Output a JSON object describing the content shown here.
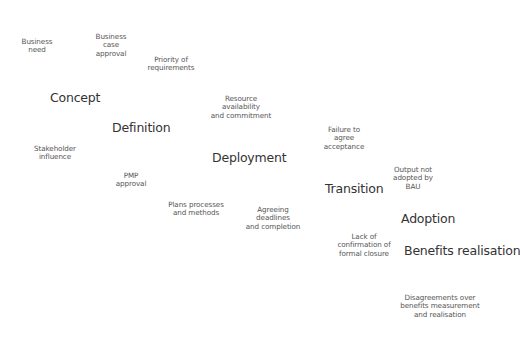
{
  "diagram": {
    "stages": [
      {
        "label": "Concept",
        "x": 50,
        "y": 90
      },
      {
        "label": "Definition",
        "x": 112,
        "y": 120
      },
      {
        "label": "Deployment",
        "x": 212,
        "y": 150
      },
      {
        "label": "Transition",
        "x": 325,
        "y": 181
      },
      {
        "label": "Adoption",
        "x": 401,
        "y": 211
      },
      {
        "label": "Benefits realisation",
        "x": 404,
        "y": 243
      }
    ],
    "issues": [
      {
        "text": "Business\nneed",
        "cx": 37,
        "y": 38
      },
      {
        "text": "Business\ncase\napproval",
        "cx": 111,
        "y": 33
      },
      {
        "text": "Priority of\nrequirements",
        "cx": 171,
        "y": 56
      },
      {
        "text": "Stakeholder\ninfluence",
        "cx": 55,
        "y": 145
      },
      {
        "text": "Resource\navailability\nand commitment",
        "cx": 241,
        "y": 95
      },
      {
        "text": "PMP\napproval",
        "cx": 131,
        "y": 172
      },
      {
        "text": "Failure to\nagree\nacceptance",
        "cx": 344,
        "y": 126
      },
      {
        "text": "Plans processes\nand methods",
        "cx": 196,
        "y": 201
      },
      {
        "text": "Agreeing\ndeadlines\nand completion",
        "cx": 273,
        "y": 206
      },
      {
        "text": "Output not\nadopted by\nBAU",
        "cx": 413,
        "y": 166
      },
      {
        "text": "Lack of\nconfirmation of\nformal closure",
        "cx": 364,
        "y": 233
      },
      {
        "text": "Disagreements over\nbenefits measurement\nand realisation",
        "cx": 440,
        "y": 294
      }
    ]
  }
}
